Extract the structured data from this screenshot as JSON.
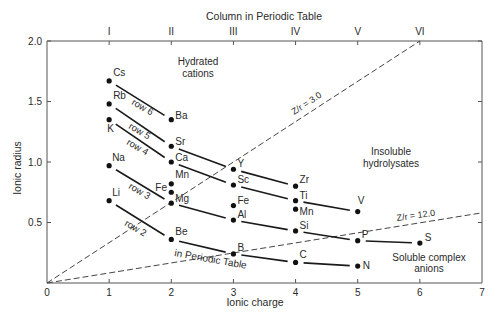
{
  "chart_data": {
    "type": "scatter",
    "title": "",
    "xlabel": "Ionic charge",
    "ylabel": "Ionic radius",
    "top_axis_label": "Column in Periodic Table",
    "xlim": [
      0,
      7
    ],
    "ylim": [
      0,
      2.0
    ],
    "x_ticks": [
      "0",
      "1",
      "2",
      "3",
      "4",
      "5",
      "6",
      "7"
    ],
    "y_ticks": [
      "0.5",
      "1.0",
      "1.5",
      "2.0"
    ],
    "top_ticks": [
      {
        "x": 1,
        "label": "I"
      },
      {
        "x": 2,
        "label": "II"
      },
      {
        "x": 3,
        "label": "III"
      },
      {
        "x": 4,
        "label": "IV"
      },
      {
        "x": 5,
        "label": "V"
      },
      {
        "x": 6,
        "label": "VI"
      }
    ],
    "grid": false,
    "points": [
      {
        "label": "Cs",
        "x": 1,
        "y": 1.67
      },
      {
        "label": "Rb",
        "x": 1,
        "y": 1.48
      },
      {
        "label": "K",
        "x": 1,
        "y": 1.35
      },
      {
        "label": "Na",
        "x": 1,
        "y": 0.97
      },
      {
        "label": "Li",
        "x": 1,
        "y": 0.68
      },
      {
        "label": "Ba",
        "x": 2,
        "y": 1.35
      },
      {
        "label": "Sr",
        "x": 2,
        "y": 1.13
      },
      {
        "label": "Ca",
        "x": 2,
        "y": 1.0
      },
      {
        "label": "Mn",
        "x": 2,
        "y": 0.82
      },
      {
        "label": "Fe",
        "x": 2,
        "y": 0.75
      },
      {
        "label": "Mg",
        "x": 2,
        "y": 0.66
      },
      {
        "label": "Be",
        "x": 2,
        "y": 0.36
      },
      {
        "label": "Y",
        "x": 3,
        "y": 0.94
      },
      {
        "label": "Sc",
        "x": 3,
        "y": 0.81
      },
      {
        "label": "Fe",
        "x": 3,
        "y": 0.64
      },
      {
        "label": "Al",
        "x": 3,
        "y": 0.52
      },
      {
        "label": "B",
        "x": 3,
        "y": 0.24
      },
      {
        "label": "Zr",
        "x": 4,
        "y": 0.8
      },
      {
        "label": "Ti",
        "x": 4,
        "y": 0.68
      },
      {
        "label": "Mn",
        "x": 4,
        "y": 0.61
      },
      {
        "label": "Si",
        "x": 4,
        "y": 0.43
      },
      {
        "label": "C",
        "x": 4,
        "y": 0.17
      },
      {
        "label": "V",
        "x": 5,
        "y": 0.59
      },
      {
        "label": "P",
        "x": 5,
        "y": 0.35
      },
      {
        "label": "N",
        "x": 5,
        "y": 0.14
      },
      {
        "label": "S",
        "x": 6,
        "y": 0.33
      }
    ],
    "series": [
      {
        "name": "row 6",
        "points": [
          "Cs",
          "Ba"
        ],
        "values": [
          [
            1,
            1.67
          ],
          [
            2,
            1.35
          ]
        ]
      },
      {
        "name": "row 5",
        "points": [
          "Rb",
          "Sr",
          "Y",
          "Zr"
        ],
        "values": [
          [
            1,
            1.48
          ],
          [
            2,
            1.13
          ],
          [
            3,
            0.94
          ],
          [
            4,
            0.8
          ]
        ]
      },
      {
        "name": "row 4",
        "points": [
          "K",
          "Ca",
          "Sc",
          "Ti",
          "V"
        ],
        "values": [
          [
            1,
            1.35
          ],
          [
            2,
            1.0
          ],
          [
            3,
            0.81
          ],
          [
            4,
            0.68
          ],
          [
            5,
            0.59
          ]
        ]
      },
      {
        "name": "row 3",
        "points": [
          "Na",
          "Mg",
          "Al",
          "Si",
          "P",
          "S"
        ],
        "values": [
          [
            1,
            0.97
          ],
          [
            2,
            0.66
          ],
          [
            3,
            0.52
          ],
          [
            4,
            0.43
          ],
          [
            5,
            0.35
          ],
          [
            6,
            0.33
          ]
        ]
      },
      {
        "name": "row 2",
        "points": [
          "Li",
          "Be",
          "B",
          "C",
          "N"
        ],
        "values": [
          [
            1,
            0.68
          ],
          [
            2,
            0.36
          ],
          [
            3,
            0.24
          ],
          [
            4,
            0.17
          ],
          [
            5,
            0.14
          ]
        ]
      }
    ],
    "reference_lines": [
      {
        "label": "Z/r = 3.0",
        "style": "dashed",
        "from": [
          0,
          0
        ],
        "to": [
          6,
          2.0
        ]
      },
      {
        "label": "Z/r = 12.0",
        "style": "dashed",
        "from": [
          0,
          0
        ],
        "to": [
          7,
          0.58
        ]
      }
    ],
    "annotations": [
      {
        "text": "Hydrated",
        "x": 2.6,
        "y": 1.78
      },
      {
        "text": "cations",
        "x": 2.6,
        "y": 1.68
      },
      {
        "text": "Insoluble",
        "x": 5.5,
        "y": 1.0
      },
      {
        "text": "hydrolysates",
        "x": 5.5,
        "y": 0.9
      },
      {
        "text": "Soluble complex",
        "x": 6.0,
        "y": 0.2
      },
      {
        "text": "anions",
        "x": 6.0,
        "y": 0.11
      },
      {
        "text": "in Periodic Table",
        "x": 2.6,
        "y": 0.18
      }
    ]
  },
  "labels": {
    "top_axis_title": "Column in Periodic Table",
    "x_axis_title": "Ionic charge",
    "y_axis_title": "Ionic radius",
    "hydrated_1": "Hydrated",
    "hydrated_2": "cations",
    "insoluble_1": "Insoluble",
    "insoluble_2": "hydrolysates",
    "soluble_1": "Soluble complex",
    "soluble_2": "anions",
    "in_periodic_table": "in Periodic Table",
    "zr3": "Z/r = 3.0",
    "zr12": "Z/r = 12.0",
    "row6": "row 6",
    "row5": "row 5",
    "row4": "row 4",
    "row3": "row 3",
    "row2": "row 2"
  }
}
